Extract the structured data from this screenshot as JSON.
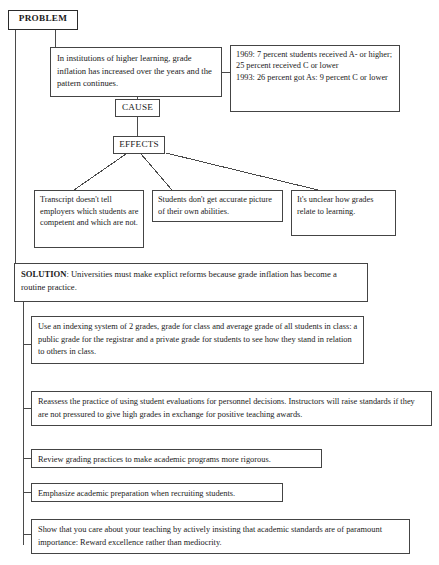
{
  "diagram": {
    "type": "flow-chart",
    "line_color": "#444444",
    "background_color": "#ffffff"
  },
  "labels": {
    "problem": "PROBLEM",
    "cause": "CAUSE",
    "effects": "EFFECTS"
  },
  "problem_statement": "In institutions of higher learning, grade inflation has increased over the years and the pattern continues.",
  "statistics": "1969: 7 percent students received A- or higher; 25 percent received C or lower\n1993: 26 percent got As: 9 percent C or lower",
  "effects": [
    "Transcript doesn't tell employers which students are competent and which are not.",
    "Students don't get accurate picture of their own abilities.",
    "It's unclear how grades relate to learning."
  ],
  "solution": {
    "lead": "SOLUTION",
    "text": ": Universities must make explict reforms because grade inflation has become a routine practice."
  },
  "steps": [
    "Use an indexing system of 2 grades, grade for class and average grade of all students in class: a public grade for the registrar and a private grade for students to see how they stand in relation to others in class.",
    "Reassess the practice of using student evaluations for personnel decisions. Instructors will raise standards if they are not pressured to give high grades in exchange for positive teaching awards.",
    "Review grading practices to make academic programs more rigorous.",
    "Emphasize academic preparation when recruiting students.",
    "Show that you care about your teaching by actively insisting that academic standards are of paramount importance: Reward excellence rather than mediocrity."
  ]
}
